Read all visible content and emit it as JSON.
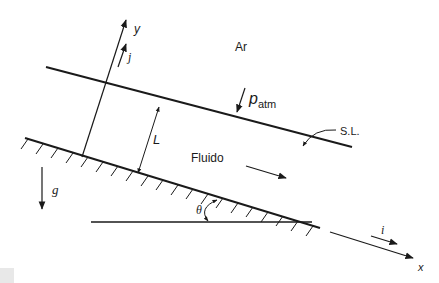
{
  "diagram": {
    "type": "inclined-plane-fluid-film",
    "colors": {
      "line": "#1a1a1a",
      "background": "#ffffff"
    },
    "labels": {
      "air": "Ar",
      "fluid": "Fluido",
      "free_surface": "S.L.",
      "pressure_symbol": "p",
      "pressure_subscript": "atm",
      "thickness": "L",
      "angle": "θ",
      "gravity": "g⃗",
      "x_axis": "x",
      "y_axis": "y",
      "unit_x": "i⃗",
      "unit_y": "j⃗"
    },
    "elements": [
      "free-surface-line",
      "inclined-wall-with-hatching",
      "horizontal-reference-line",
      "y-axis-arrow",
      "x-axis-arrow",
      "thickness-dimension",
      "pressure-arrow",
      "flow-direction-arrow",
      "gravity-arrow",
      "angle-arc",
      "free-surface-leader"
    ]
  }
}
